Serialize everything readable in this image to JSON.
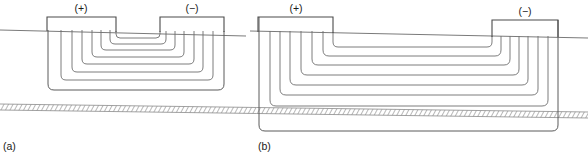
{
  "figure": {
    "caption_a": "(a)",
    "caption_b": "(b)",
    "colors": {
      "line": "#6e6e6e",
      "electrode": "#4a4a4a",
      "surface": "#7a7a7a",
      "substrate_fill": "#d8d8d8",
      "text": "#1a1a1a",
      "background": "#ffffff"
    }
  },
  "panel_a": {
    "caption": "(a)",
    "positive_label": "(+)",
    "negative_label": "(−)",
    "electrode_count": 2,
    "flow_line_count": 8,
    "electrodes": [
      {
        "polarity": "(+)",
        "x_left": 47,
        "x_right": 116,
        "y_top": 17,
        "y_bottom": 31,
        "label_x": 81,
        "label_y": 12
      },
      {
        "polarity": "(−)",
        "x_left": 160,
        "x_right": 224,
        "y_top": 17,
        "y_bottom": 31,
        "label_x": 192,
        "label_y": 12
      }
    ],
    "surface_line": {
      "x_start": 0,
      "y_start": 30,
      "x_end": 246,
      "y_end": 36
    },
    "loops": [
      {
        "index": 0,
        "left_x": 116,
        "right_x": 160,
        "depth_y": 38
      },
      {
        "index": 1,
        "left_x": 110,
        "right_x": 166,
        "depth_y": 44
      },
      {
        "index": 2,
        "left_x": 101,
        "right_x": 175,
        "depth_y": 50
      },
      {
        "index": 3,
        "left_x": 92,
        "right_x": 184,
        "depth_y": 57
      },
      {
        "index": 4,
        "left_x": 82,
        "right_x": 194,
        "depth_y": 64
      },
      {
        "index": 5,
        "left_x": 72,
        "right_x": 203,
        "depth_y": 72
      },
      {
        "index": 6,
        "left_x": 61,
        "right_x": 213,
        "depth_y": 80
      },
      {
        "index": 7,
        "left_x": 48,
        "right_x": 224,
        "depth_y": 90
      }
    ],
    "description": "Closely spaced electrode pair; current flow lines remain shallow and do not reach the buried conductive layer."
  },
  "panel_b": {
    "caption": "(b)",
    "positive_label": "(+)",
    "negative_label": "(−)",
    "electrode_count": 2,
    "flow_line_count": 8,
    "electrodes": [
      {
        "polarity": "(+)",
        "x_left": 258,
        "x_right": 333,
        "y_top": 17,
        "y_bottom": 32,
        "label_x": 296,
        "label_y": 12
      },
      {
        "polarity": "(−)",
        "x_left": 492,
        "x_right": 558,
        "y_top": 20,
        "y_bottom": 36,
        "label_x": 525,
        "label_y": 14
      }
    ],
    "surface_line": {
      "x_start": 250,
      "y_start": 31,
      "x_end": 588,
      "y_end": 38
    },
    "loops": [
      {
        "index": 0,
        "left_x": 333,
        "right_x": 492,
        "depth_y": 47
      },
      {
        "index": 1,
        "left_x": 323,
        "right_x": 501,
        "depth_y": 56
      },
      {
        "index": 2,
        "left_x": 312,
        "right_x": 510,
        "depth_y": 65
      },
      {
        "index": 3,
        "left_x": 301,
        "right_x": 519,
        "depth_y": 75
      },
      {
        "index": 4,
        "left_x": 290,
        "right_x": 528,
        "depth_y": 85
      },
      {
        "index": 5,
        "left_x": 280,
        "right_x": 538,
        "depth_y": 95
      },
      {
        "index": 6,
        "left_x": 270,
        "right_x": 548,
        "depth_y": 106
      },
      {
        "index": 7,
        "left_x": 259,
        "right_x": 558,
        "depth_y": 131
      }
    ],
    "description": "Widely spaced electrode pair; current flow lines penetrate deeply and the outermost line passes through the buried conductive layer."
  },
  "substrate": {
    "name": "buried conductive layer",
    "hatch_pattern": "diagonal-hatch",
    "left_top_y": 104,
    "left_bottom_y": 110,
    "right_top_y": 112,
    "right_bottom_y": 118,
    "x_start": 0,
    "x_end": 588
  }
}
